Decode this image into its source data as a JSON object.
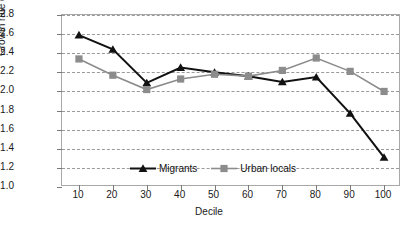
{
  "chart_data": {
    "type": "line",
    "title": "",
    "xlabel": "Decile",
    "ylabel": "Growth rate of wages (%)",
    "categories": [
      10,
      20,
      30,
      40,
      50,
      60,
      70,
      80,
      90,
      100
    ],
    "xtick_labels": [
      "10",
      "20",
      "30",
      "40",
      "50",
      "60",
      "70",
      "80",
      "90",
      "100"
    ],
    "ytick_labels": [
      "1.0",
      "1.2",
      "1.4",
      "1.6",
      "1.8",
      "2.0",
      "2.2",
      "2.4",
      "2.6",
      "2.8"
    ],
    "ylim": [
      1.0,
      2.8
    ],
    "xlim": [
      5,
      105
    ],
    "grid": true,
    "legend_position": "inside-bottom-left",
    "series": [
      {
        "name": "Migrants",
        "color": "#111111",
        "marker": "triangle",
        "values": [
          2.59,
          2.44,
          2.09,
          2.25,
          2.2,
          2.16,
          2.1,
          2.15,
          1.77,
          1.31
        ]
      },
      {
        "name": "Urban locals",
        "color": "#8c8c8c",
        "marker": "square",
        "values": [
          2.34,
          2.17,
          2.02,
          2.13,
          2.18,
          2.16,
          2.22,
          2.35,
          2.21,
          2.0
        ]
      }
    ]
  },
  "colors": {
    "migrants": "#111111",
    "urban_locals": "#8c8c8c",
    "grid": "#9a9a9a",
    "frame": "#a8a8a8",
    "text": "#1a1a1a"
  }
}
